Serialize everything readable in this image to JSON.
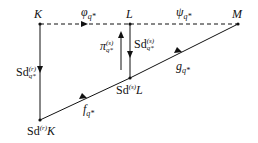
{
  "diagram": {
    "type": "commutative-diagram",
    "nodes": {
      "K": {
        "label": "K",
        "x": 40,
        "y": 24
      },
      "L": {
        "label": "L",
        "x": 130,
        "y": 24
      },
      "M": {
        "label": "M",
        "x": 238,
        "y": 24
      },
      "SdrK": {
        "label_prefix": "Sd",
        "label_sup": "(r)",
        "label_suffix": "K",
        "x": 40,
        "y": 120
      },
      "SdsL": {
        "label_prefix": "Sd",
        "label_sup": "(s)",
        "label_suffix": "L",
        "x": 130,
        "y": 78
      }
    },
    "arrows": {
      "phi": {
        "from": "K",
        "to": "L",
        "style": "dashed",
        "label_base": "φ",
        "label_sub": "q*"
      },
      "psi": {
        "from": "L",
        "to": "M",
        "style": "dashed",
        "label_base": "ψ",
        "label_sub": "q*"
      },
      "sdr": {
        "from": "K",
        "to": "SdrK",
        "style": "solid",
        "label_prefix": "Sd",
        "label_sup": "(r)",
        "label_sub": "q*"
      },
      "sds": {
        "from": "L",
        "to": "SdsL",
        "style": "solid",
        "label_prefix": "Sd",
        "label_sup": "(s)",
        "label_sub": "q*"
      },
      "pi": {
        "from": "SdsL",
        "to": "L",
        "style": "solid",
        "label_base": "π",
        "label_sup": "(s)",
        "label_sub": "q*"
      },
      "f": {
        "from": "SdrK",
        "to": "SdsL",
        "style": "solid",
        "label_base": "f",
        "label_sub": "q*"
      },
      "g": {
        "from": "SdsL",
        "to": "M",
        "style": "solid",
        "label_base": "g",
        "label_sub": "q*"
      }
    }
  }
}
